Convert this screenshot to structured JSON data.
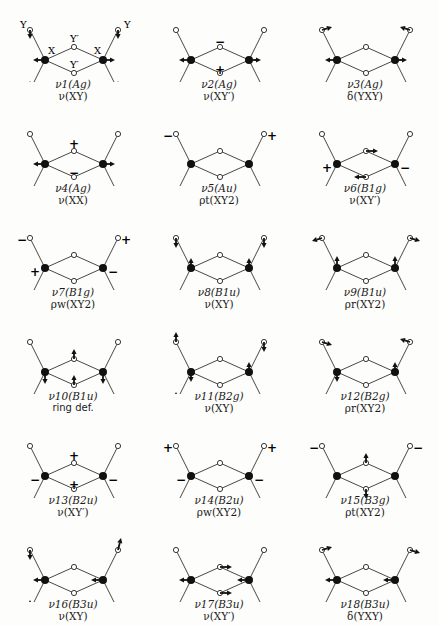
{
  "atom_labels": {
    "X": "X",
    "Y": "Y",
    "Y_prime": "Y′"
  },
  "modes": [
    {
      "id": 1,
      "symmetry": "ν1(Ag)",
      "description": "ν(XY)"
    },
    {
      "id": 2,
      "symmetry": "ν2(Ag)",
      "description": "ν(XY′)"
    },
    {
      "id": 3,
      "symmetry": "ν3(Ag)",
      "description": "δ(YXY)"
    },
    {
      "id": 4,
      "symmetry": "ν4(Ag)",
      "description": "ν(XX)"
    },
    {
      "id": 5,
      "symmetry": "ν5(Au)",
      "description": "ρt(XY2)"
    },
    {
      "id": 6,
      "symmetry": "ν6(B1g)",
      "description": "ν(XY′)"
    },
    {
      "id": 7,
      "symmetry": "ν7(B1g)",
      "description": "ρw(XY2)"
    },
    {
      "id": 8,
      "symmetry": "ν8(B1u)",
      "description": "ν(XY)"
    },
    {
      "id": 9,
      "symmetry": "ν9(B1u)",
      "description": "ρr(XY2)"
    },
    {
      "id": 10,
      "symmetry": "ν10(B1u)",
      "description": "ring def."
    },
    {
      "id": 11,
      "symmetry": "ν11(B2g)",
      "description": "ν(XY)"
    },
    {
      "id": 12,
      "symmetry": "ν12(B2g)",
      "description": "ρr(XY2)"
    },
    {
      "id": 13,
      "symmetry": "ν13(B2u)",
      "description": "ν(XY′)"
    },
    {
      "id": 14,
      "symmetry": "ν14(B2u)",
      "description": "ρw(XY2)"
    },
    {
      "id": 15,
      "symmetry": "ν15(B3g)",
      "description": "ρt(XY2)"
    },
    {
      "id": 16,
      "symmetry": "ν16(B3u)",
      "description": "ν(XY)"
    },
    {
      "id": 17,
      "symmetry": "ν17(B3u)",
      "description": "ν(XY′)"
    },
    {
      "id": 18,
      "symmetry": "ν18(B3u)",
      "description": "δ(YXY)"
    }
  ],
  "signs": {
    "plus": "+",
    "minus": "−"
  }
}
